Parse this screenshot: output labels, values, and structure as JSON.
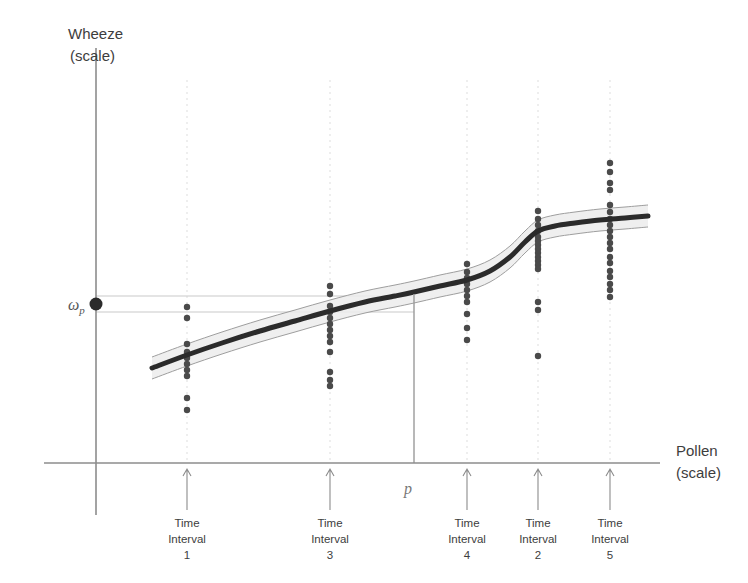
{
  "chart_data": {
    "type": "scatter",
    "title": "",
    "xlabel": "Pollen (scale)",
    "ylabel": "Wheeze (scale)",
    "xlabel_line1": "Pollen",
    "xlabel_line2": "(scale)",
    "ylabel_line1": "Wheeze",
    "ylabel_line2": "(scale)",
    "grid": "faint vertical dotted gridlines at each time-interval tick",
    "legend": "none",
    "axes": {
      "x_axis_y": 463,
      "y_axis_x": 96,
      "x_min_px": 96,
      "x_max_px": 660,
      "y_top_px": 48,
      "y_bottom_px": 515
    },
    "annotations": [
      {
        "name": "omega-p",
        "label": "ω",
        "subscript": "p",
        "description": "predicted wheeze value at pollen level p, marked on the y-axis",
        "x_px": 96,
        "y_px": 304
      },
      {
        "name": "p",
        "label": "p",
        "description": "pollen cut-point, vertical reference line",
        "x_px": 414,
        "y_px": 489
      }
    ],
    "reference_lines": {
      "vertical_p": {
        "x_px": 414,
        "y_top_px": 294,
        "y_bottom_px": 463,
        "color": "#9a9a9a"
      },
      "horizontal_upper": {
        "y_px": 296,
        "x_start_px": 96,
        "x_end_px": 414,
        "color": "#c9c9c9"
      },
      "horizontal_lower": {
        "y_px": 312,
        "x_start_px": 96,
        "x_end_px": 414,
        "color": "#c9c9c9"
      }
    },
    "fit_curve": {
      "name": "smoothed-fit-line",
      "color": "#2b2b2b",
      "width_px": 5,
      "points": [
        [
          152,
          368
        ],
        [
          187,
          355
        ],
        [
          222,
          343
        ],
        [
          260,
          331
        ],
        [
          295,
          321
        ],
        [
          330,
          311
        ],
        [
          365,
          302
        ],
        [
          395,
          296
        ],
        [
          414,
          292
        ],
        [
          440,
          286
        ],
        [
          467,
          280
        ],
        [
          490,
          271
        ],
        [
          510,
          257
        ],
        [
          525,
          242
        ],
        [
          538,
          231
        ],
        [
          555,
          226
        ],
        [
          575,
          223
        ],
        [
          600,
          220
        ],
        [
          625,
          218
        ],
        [
          648,
          216
        ]
      ]
    },
    "confidence_band": {
      "name": "confidence-band",
      "fill": "#ececec",
      "stroke": "#9e9e9e",
      "half_width_px": 11,
      "description": "shaded pointwise confidence band around the fitted curve"
    },
    "categories": [
      "Time Interval 1",
      "Time Interval 3",
      "Time Interval 4",
      "Time Interval 2",
      "Time Interval 5"
    ],
    "tick_marks": [
      {
        "label_line1": "Time",
        "label_line2": "Interval",
        "label_line3": "1",
        "x_px": 187
      },
      {
        "label_line1": "Time",
        "label_line2": "Interval",
        "label_line3": "3",
        "x_px": 330
      },
      {
        "label_line1": "Time",
        "label_line2": "Interval",
        "label_line3": "4",
        "x_px": 467
      },
      {
        "label_line1": "Time",
        "label_line2": "Interval",
        "label_line3": "2",
        "x_px": 538
      },
      {
        "label_line1": "Time",
        "label_line2": "Interval",
        "label_line3": "5",
        "x_px": 610
      }
    ],
    "clusters": [
      {
        "name": "Time Interval 1",
        "x_px": 187,
        "n_points": 11,
        "y_px": [
          307,
          318,
          344,
          352,
          358,
          364,
          370,
          376,
          398,
          410
        ]
      },
      {
        "name": "Time Interval 3",
        "x_px": 330,
        "n_points": 13,
        "y_px": [
          286,
          294,
          306,
          312,
          318,
          324,
          330,
          336,
          342,
          352,
          372,
          380,
          386
        ]
      },
      {
        "name": "Time Interval 4",
        "x_px": 467,
        "n_points": 10,
        "y_px": [
          264,
          272,
          278,
          284,
          290,
          296,
          302,
          314,
          328,
          340
        ]
      },
      {
        "name": "Time Interval 2",
        "x_px": 538,
        "n_points": 15,
        "y_px": [
          211,
          219,
          225,
          231,
          237,
          241,
          245,
          249,
          253,
          257,
          261,
          265,
          269,
          302,
          310,
          356
        ]
      },
      {
        "name": "Time Interval 5",
        "x_px": 610,
        "n_points": 16,
        "y_px": [
          163,
          172,
          183,
          190,
          205,
          212,
          219,
          225,
          231,
          237,
          243,
          249,
          257,
          263,
          271,
          277,
          284,
          290,
          297
        ]
      }
    ],
    "point_style": {
      "color": "#4a4a4a",
      "radius_px": 3.2,
      "shape": "circle"
    },
    "gridlines_x_px": [
      187,
      330,
      467,
      538,
      610
    ],
    "colors": {
      "axis": "#8c8c8c",
      "point": "#4a4a4a",
      "curve": "#2b2b2b",
      "band_fill": "#ececec",
      "band_stroke": "#9e9e9e",
      "gridline": "#dddddd",
      "text": "#3d3d3d"
    }
  }
}
